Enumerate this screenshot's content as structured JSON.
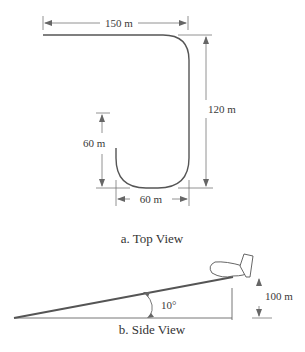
{
  "top_view": {
    "caption": "a. Top View",
    "dimensions": {
      "top_width": "150 m",
      "right_height": "120 m",
      "left_height": "60 m",
      "bottom_width": "60 m"
    }
  },
  "side_view": {
    "caption": "b. Side View",
    "angle": "10°",
    "height": "100 m"
  },
  "colors": {
    "path": "#555555",
    "dimension_line": "#666666",
    "text": "#333333"
  }
}
